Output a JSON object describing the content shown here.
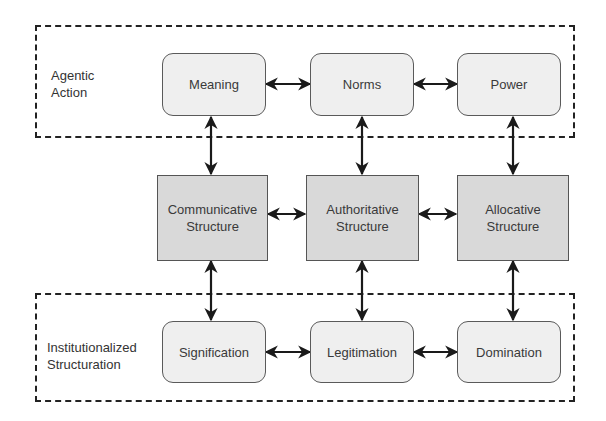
{
  "diagram": {
    "groups": {
      "agentic": {
        "label_line1": "Agentic",
        "label_line2": "Action"
      },
      "institutional": {
        "label_line1": "Institutionalized",
        "label_line2": "Structuration"
      }
    },
    "top_row": [
      {
        "id": "meaning",
        "label": "Meaning"
      },
      {
        "id": "norms",
        "label": "Norms"
      },
      {
        "id": "power",
        "label": "Power"
      }
    ],
    "middle_row": [
      {
        "id": "communicative",
        "label_line1": "Communicative",
        "label_line2": "Structure"
      },
      {
        "id": "authoritative",
        "label_line1": "Authoritative",
        "label_line2": "Structure"
      },
      {
        "id": "allocative",
        "label_line1": "Allocative",
        "label_line2": "Structure"
      }
    ],
    "bottom_row": [
      {
        "id": "signification",
        "label": "Signification"
      },
      {
        "id": "legitimation",
        "label": "Legitimation"
      },
      {
        "id": "domination",
        "label": "Domination"
      }
    ],
    "edges": [
      {
        "from": "meaning",
        "to": "norms",
        "type": "bidirectional"
      },
      {
        "from": "norms",
        "to": "power",
        "type": "bidirectional"
      },
      {
        "from": "communicative",
        "to": "authoritative",
        "type": "bidirectional"
      },
      {
        "from": "authoritative",
        "to": "allocative",
        "type": "bidirectional"
      },
      {
        "from": "signification",
        "to": "legitimation",
        "type": "bidirectional"
      },
      {
        "from": "legitimation",
        "to": "domination",
        "type": "bidirectional"
      },
      {
        "from": "meaning",
        "to": "communicative",
        "type": "bidirectional"
      },
      {
        "from": "norms",
        "to": "authoritative",
        "type": "bidirectional"
      },
      {
        "from": "power",
        "to": "allocative",
        "type": "bidirectional"
      },
      {
        "from": "communicative",
        "to": "signification",
        "type": "bidirectional"
      },
      {
        "from": "authoritative",
        "to": "legitimation",
        "type": "bidirectional"
      },
      {
        "from": "allocative",
        "to": "domination",
        "type": "bidirectional"
      }
    ],
    "colors": {
      "rounded_fill": "#efefef",
      "structure_fill": "#d9d9d9",
      "border": "#555555",
      "arrow": "#1a1a1a"
    }
  }
}
